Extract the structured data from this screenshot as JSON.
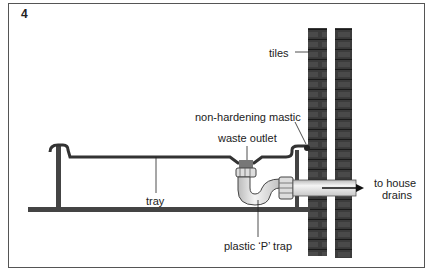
{
  "figure": {
    "number": "4",
    "labels": {
      "tiles": "tiles",
      "mastic": "non-hardening mastic",
      "waste_outlet": "waste outlet",
      "tray": "tray",
      "trap": "plastic ‘P’ trap",
      "drains_line1": "to house",
      "drains_line2": "drains"
    }
  },
  "colors": {
    "ink": "#222222",
    "wall": "#3a3a3a",
    "pipe": "#e4e4e4",
    "frame": "#555555"
  }
}
